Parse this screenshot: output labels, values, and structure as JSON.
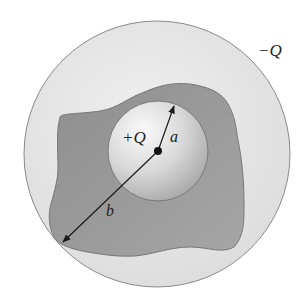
{
  "diagram": {
    "labels": {
      "outer_charge": "−Q",
      "inner_charge": "+Q",
      "inner_radius": "a",
      "outer_radius": "b"
    },
    "colors": {
      "outer_sphere_fill": "#e6e6e6",
      "outer_sphere_stroke": "#8a8a8a",
      "irregular_region_fill": "#9a9a9a",
      "irregular_region_stroke": "#777777",
      "inner_sphere_highlight": "#f4f4f4",
      "inner_sphere_shade": "#b8b8b8",
      "arrow_color": "#1a1a1a"
    },
    "geometry": {
      "outer_center": [
        157,
        154
      ],
      "outer_radius_px": 133,
      "inner_center": [
        158,
        151
      ],
      "inner_radius_px": 50,
      "center_dot": [
        158,
        151
      ]
    }
  }
}
